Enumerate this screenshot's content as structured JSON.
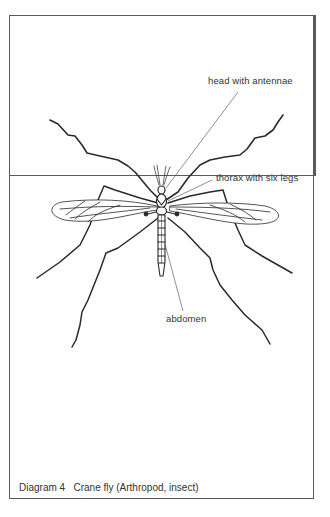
{
  "diagram": {
    "labels": {
      "head": "head with antennae",
      "thorax": "thorax with six legs",
      "abdomen": "abdomen"
    },
    "caption": "Diagram 4   Crane fly (Arthropod, insect)",
    "colors": {
      "ink": "#2a2a2a",
      "frame": "#5a5a5a",
      "background": "#ffffff"
    }
  }
}
